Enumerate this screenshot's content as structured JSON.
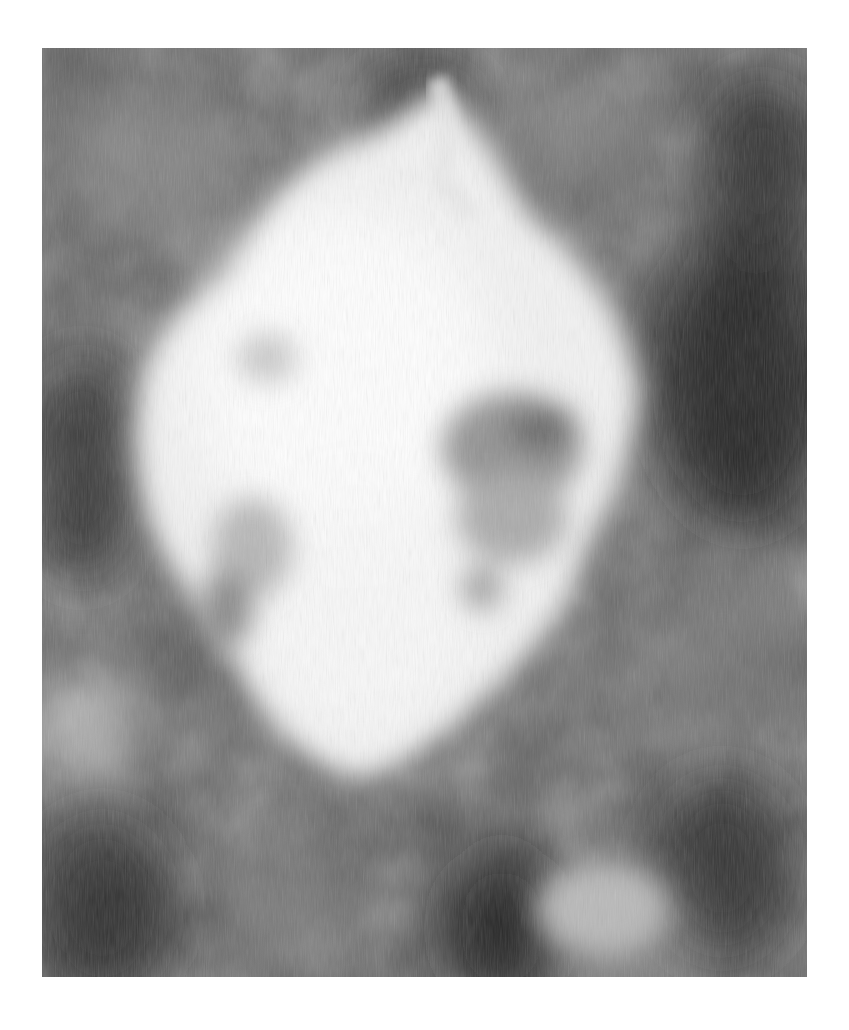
{
  "artwork": {
    "description": "Grayscale abstract painting with a large luminous white cloud-like form on a dark mottled gray ground",
    "palette": {
      "background_page": "#ffffff",
      "ground_dark": "#2a2a2a",
      "ground_mid": "#5a5a5a",
      "ground_light": "#8a8a8a",
      "cloud_white": "#f4f4f4",
      "cloud_shadow": "#9a9a9a"
    },
    "frame": {
      "x": 42,
      "y": 48,
      "width": 765,
      "height": 929
    }
  }
}
